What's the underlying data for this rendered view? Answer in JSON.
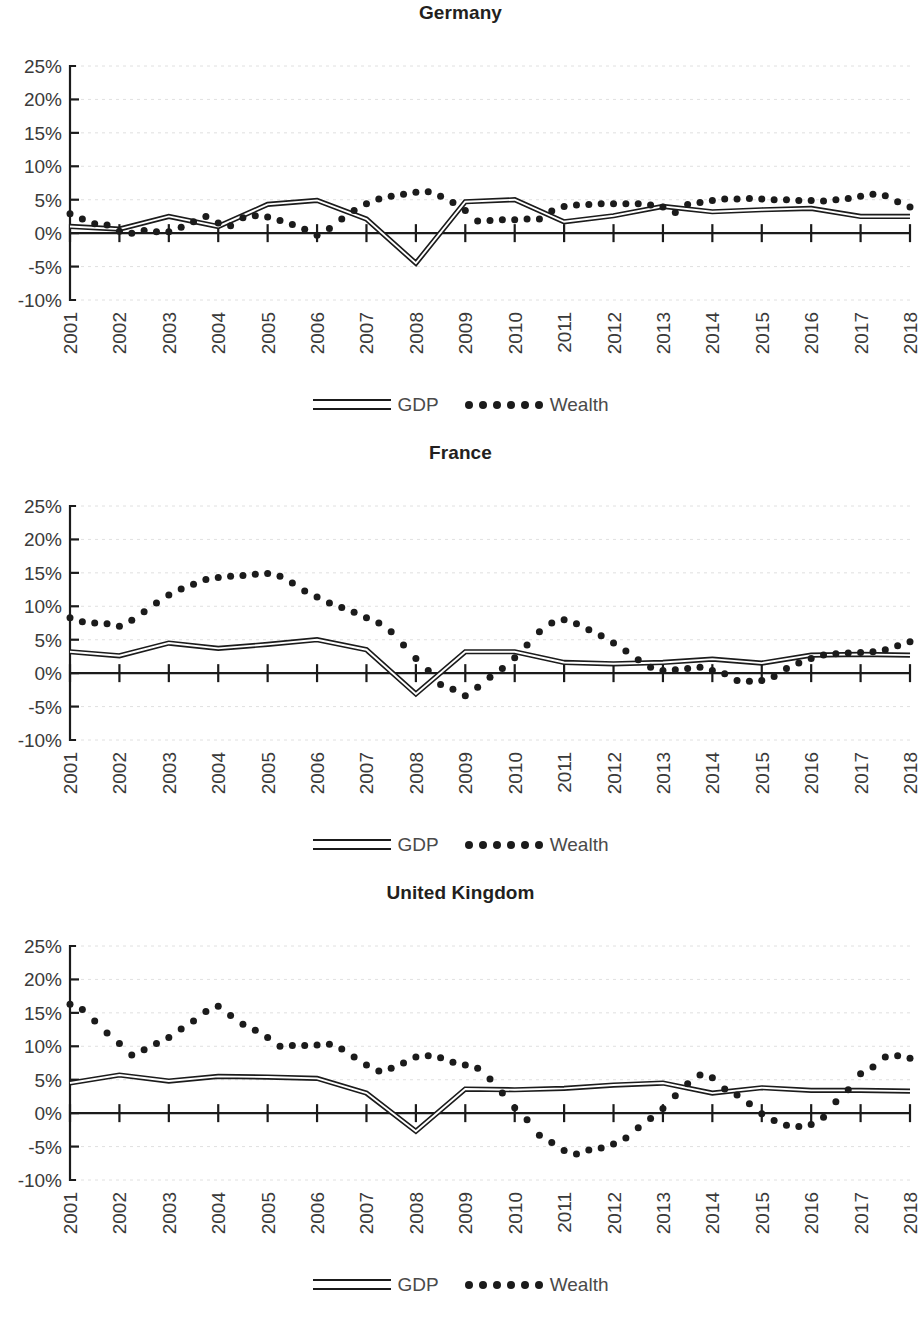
{
  "figure": {
    "panels_count": 3,
    "legend": {
      "gdp_label": "GDP",
      "wealth_label": "Wealth",
      "gdp_icon": "double-line-swatch",
      "wealth_icon": "dotted-line-swatch"
    },
    "y_ticks": [
      "25%",
      "20%",
      "15%",
      "10%",
      "5%",
      "0%",
      "-5%",
      "-10%"
    ],
    "x_ticks": [
      "2001",
      "2002",
      "2003",
      "2004",
      "2005",
      "2006",
      "2007",
      "2008",
      "2009",
      "2010",
      "2011",
      "2012",
      "2013",
      "2014",
      "2015",
      "2016",
      "2017",
      "2018"
    ],
    "colors": {
      "ink": "#1b1b1b",
      "axis_text": "#3a3a3a",
      "grid": "#d8d8d8",
      "background": "#ffffff"
    }
  },
  "chart_data": [
    {
      "type": "line",
      "title": "Germany",
      "xlabel": "",
      "ylabel": "",
      "ylim": [
        -10,
        25
      ],
      "yticks": [
        -10,
        -5,
        0,
        5,
        10,
        15,
        20,
        25
      ],
      "ytick_labels": [
        "-10%",
        "-5%",
        "0%",
        "5%",
        "10%",
        "15%",
        "20%",
        "25%"
      ],
      "grid": true,
      "legend_position": "bottom-center",
      "categories": [
        "2001",
        "2002",
        "2003",
        "2004",
        "2005",
        "2006",
        "2007",
        "2008",
        "2009",
        "2010",
        "2011",
        "2012",
        "2013",
        "2014",
        "2015",
        "2016",
        "2017",
        "2018"
      ],
      "series": [
        {
          "name": "GDP",
          "style": "line",
          "frequency": "annual",
          "x": [
            2001,
            2002,
            2003,
            2004,
            2005,
            2006,
            2007,
            2008,
            2009,
            2010,
            2011,
            2012,
            2013,
            2014,
            2015,
            2016,
            2017,
            2018
          ],
          "values": [
            1.0,
            0.6,
            2.5,
            1.0,
            4.3,
            4.9,
            2.1,
            -4.5,
            4.7,
            5.0,
            1.7,
            2.6,
            4.0,
            3.2,
            3.5,
            3.7,
            2.5,
            2.5
          ]
        },
        {
          "name": "Wealth",
          "style": "dots",
          "frequency": "quarterly",
          "x": [
            2001.0,
            2001.25,
            2001.5,
            2001.75,
            2002.0,
            2002.25,
            2002.5,
            2002.75,
            2003.0,
            2003.25,
            2003.5,
            2003.75,
            2004.0,
            2004.25,
            2004.5,
            2004.75,
            2005.0,
            2005.25,
            2005.5,
            2005.75,
            2006.0,
            2006.25,
            2006.5,
            2006.75,
            2007.0,
            2007.25,
            2007.5,
            2007.75,
            2008.0,
            2008.25,
            2008.5,
            2008.75,
            2009.0,
            2009.25,
            2009.5,
            2009.75,
            2010.0,
            2010.25,
            2010.5,
            2010.75,
            2011.0,
            2011.25,
            2011.5,
            2011.75,
            2012.0,
            2012.25,
            2012.5,
            2012.75,
            2013.0,
            2013.25,
            2013.5,
            2013.75,
            2014.0,
            2014.25,
            2014.5,
            2014.75,
            2015.0,
            2015.25,
            2015.5,
            2015.75,
            2016.0,
            2016.25,
            2016.5,
            2016.75,
            2017.0,
            2017.25,
            2017.5,
            2017.75,
            2018.0
          ],
          "values": [
            2.9,
            2.1,
            1.4,
            1.2,
            0.3,
            0.0,
            0.4,
            0.2,
            0.2,
            0.9,
            1.7,
            2.5,
            1.5,
            1.1,
            2.3,
            2.6,
            2.4,
            1.9,
            1.3,
            0.6,
            -0.3,
            0.7,
            2.1,
            3.4,
            4.4,
            5.1,
            5.5,
            5.8,
            6.1,
            6.2,
            5.5,
            4.6,
            3.4,
            1.8,
            1.9,
            2.0,
            2.0,
            2.1,
            2.1,
            3.3,
            4.0,
            4.2,
            4.3,
            4.4,
            4.4,
            4.4,
            4.4,
            4.2,
            3.9,
            3.1,
            4.3,
            4.6,
            4.9,
            5.1,
            5.1,
            5.2,
            5.1,
            5.0,
            5.0,
            4.9,
            4.9,
            4.8,
            5.0,
            5.2,
            5.5,
            5.8,
            5.6,
            4.7,
            3.9
          ]
        }
      ]
    },
    {
      "type": "line",
      "title": "France",
      "xlabel": "",
      "ylabel": "",
      "ylim": [
        -10,
        25
      ],
      "yticks": [
        -10,
        -5,
        0,
        5,
        10,
        15,
        20,
        25
      ],
      "ytick_labels": [
        "-10%",
        "-5%",
        "0%",
        "5%",
        "10%",
        "15%",
        "20%",
        "25%"
      ],
      "grid": true,
      "legend_position": "bottom-center",
      "categories": [
        "2001",
        "2002",
        "2003",
        "2004",
        "2005",
        "2006",
        "2007",
        "2008",
        "2009",
        "2010",
        "2011",
        "2012",
        "2013",
        "2014",
        "2015",
        "2016",
        "2017",
        "2018"
      ],
      "series": [
        {
          "name": "GDP",
          "style": "line",
          "frequency": "annual",
          "x": [
            2001,
            2002,
            2003,
            2004,
            2005,
            2006,
            2007,
            2008,
            2009,
            2010,
            2011,
            2012,
            2013,
            2014,
            2015,
            2016,
            2017,
            2018
          ],
          "values": [
            3.2,
            2.6,
            4.5,
            3.7,
            4.3,
            5.0,
            3.5,
            -3.1,
            3.2,
            3.2,
            1.6,
            1.4,
            1.6,
            2.1,
            1.5,
            2.7,
            2.8,
            2.7
          ]
        },
        {
          "name": "Wealth",
          "style": "dots",
          "frequency": "quarterly",
          "x": [
            2001.0,
            2001.25,
            2001.5,
            2001.75,
            2002.0,
            2002.25,
            2002.5,
            2002.75,
            2003.0,
            2003.25,
            2003.5,
            2003.75,
            2004.0,
            2004.25,
            2004.5,
            2004.75,
            2005.0,
            2005.25,
            2005.5,
            2005.75,
            2006.0,
            2006.25,
            2006.5,
            2006.75,
            2007.0,
            2007.25,
            2007.5,
            2007.75,
            2008.0,
            2008.25,
            2008.5,
            2008.75,
            2009.0,
            2009.25,
            2009.5,
            2009.75,
            2010.0,
            2010.25,
            2010.5,
            2010.75,
            2011.0,
            2011.25,
            2011.5,
            2011.75,
            2012.0,
            2012.25,
            2012.5,
            2012.75,
            2013.0,
            2013.25,
            2013.5,
            2013.75,
            2014.0,
            2014.25,
            2014.5,
            2014.75,
            2015.0,
            2015.25,
            2015.5,
            2015.75,
            2016.0,
            2016.25,
            2016.5,
            2016.75,
            2017.0,
            2017.25,
            2017.5,
            2017.75,
            2018.0
          ],
          "values": [
            8.3,
            7.7,
            7.5,
            7.4,
            7.0,
            7.9,
            9.2,
            10.5,
            11.7,
            12.6,
            13.3,
            14.0,
            14.3,
            14.5,
            14.6,
            14.8,
            14.9,
            14.5,
            13.5,
            12.3,
            11.4,
            10.5,
            9.8,
            9.1,
            8.3,
            7.5,
            6.2,
            4.2,
            2.2,
            0.4,
            -1.7,
            -2.4,
            -3.4,
            -2.1,
            -0.6,
            0.7,
            2.3,
            4.2,
            6.2,
            7.5,
            8.0,
            7.4,
            6.5,
            5.6,
            4.5,
            3.3,
            2.0,
            0.9,
            0.4,
            0.5,
            0.7,
            0.9,
            0.4,
            -0.1,
            -1.1,
            -1.2,
            -1.1,
            -0.5,
            0.7,
            1.5,
            2.2,
            2.7,
            2.9,
            3.0,
            3.1,
            3.2,
            3.5,
            4.1,
            4.7
          ]
        }
      ]
    },
    {
      "type": "line",
      "title": "United Kingdom",
      "xlabel": "",
      "ylabel": "",
      "ylim": [
        -10,
        25
      ],
      "yticks": [
        -10,
        -5,
        0,
        5,
        10,
        15,
        20,
        25
      ],
      "ytick_labels": [
        "-10%",
        "-5%",
        "0%",
        "5%",
        "10%",
        "15%",
        "20%",
        "25%"
      ],
      "grid": true,
      "legend_position": "bottom-center",
      "categories": [
        "2001",
        "2002",
        "2003",
        "2004",
        "2005",
        "2006",
        "2007",
        "2008",
        "2009",
        "2010",
        "2011",
        "2012",
        "2013",
        "2014",
        "2015",
        "2016",
        "2017",
        "2018"
      ],
      "series": [
        {
          "name": "GDP",
          "style": "line",
          "frequency": "annual",
          "x": [
            2001,
            2002,
            2003,
            2004,
            2005,
            2006,
            2007,
            2008,
            2009,
            2010,
            2011,
            2012,
            2013,
            2014,
            2015,
            2016,
            2017,
            2018
          ],
          "values": [
            4.5,
            5.7,
            4.8,
            5.5,
            5.4,
            5.2,
            3.0,
            -2.7,
            3.6,
            3.5,
            3.7,
            4.2,
            4.5,
            3.0,
            3.8,
            3.4,
            3.4,
            3.3
          ]
        },
        {
          "name": "Wealth",
          "style": "dots",
          "frequency": "quarterly",
          "x": [
            2001.0,
            2001.25,
            2001.5,
            2001.75,
            2002.0,
            2002.25,
            2002.5,
            2002.75,
            2003.0,
            2003.25,
            2003.5,
            2003.75,
            2004.0,
            2004.25,
            2004.5,
            2004.75,
            2005.0,
            2005.25,
            2005.5,
            2005.75,
            2006.0,
            2006.25,
            2006.5,
            2006.75,
            2007.0,
            2007.25,
            2007.5,
            2007.75,
            2008.0,
            2008.25,
            2008.5,
            2008.75,
            2009.0,
            2009.25,
            2009.5,
            2009.75,
            2010.0,
            2010.25,
            2010.5,
            2010.75,
            2011.0,
            2011.25,
            2011.5,
            2011.75,
            2012.0,
            2012.25,
            2012.5,
            2012.75,
            2013.0,
            2013.25,
            2013.5,
            2013.75,
            2014.0,
            2014.25,
            2014.5,
            2014.75,
            2015.0,
            2015.25,
            2015.5,
            2015.75,
            2016.0,
            2016.25,
            2016.5,
            2016.75,
            2017.0,
            2017.25,
            2017.5,
            2017.75,
            2018.0
          ],
          "values": [
            16.3,
            15.5,
            13.8,
            12.0,
            10.4,
            8.7,
            9.5,
            10.4,
            11.3,
            12.6,
            13.8,
            15.2,
            16.0,
            14.6,
            13.3,
            12.4,
            11.3,
            10.0,
            10.1,
            10.1,
            10.2,
            10.3,
            9.6,
            8.4,
            7.2,
            6.3,
            6.7,
            7.5,
            8.4,
            8.6,
            8.3,
            7.6,
            7.2,
            6.7,
            5.1,
            3.0,
            0.8,
            -1.0,
            -3.3,
            -4.4,
            -5.6,
            -6.1,
            -5.5,
            -5.2,
            -4.6,
            -3.7,
            -2.2,
            -0.8,
            0.7,
            2.6,
            4.4,
            5.7,
            5.3,
            3.6,
            2.7,
            1.4,
            -0.1,
            -1.1,
            -1.8,
            -2.0,
            -1.7,
            -0.6,
            1.7,
            3.5,
            5.9,
            6.9,
            8.4,
            8.6,
            8.2
          ]
        }
      ]
    }
  ]
}
